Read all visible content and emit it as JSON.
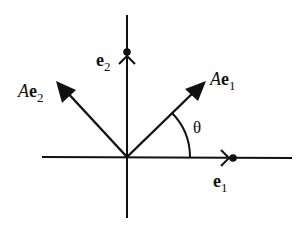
{
  "diagram": {
    "colors": {
      "stroke": "#111111",
      "background": "#ffffff"
    },
    "axes": {
      "horizontal": {
        "x1": 42,
        "y1": 157,
        "x2": 292,
        "y2": 158
      },
      "vertical": {
        "x1": 127,
        "y1": 15,
        "x2": 127,
        "y2": 218
      }
    },
    "origin": {
      "x": 127,
      "y": 157
    },
    "basis_vectors": [
      {
        "name": "e1",
        "label_main": "e",
        "label_sub": "1",
        "dot": {
          "x": 233,
          "y": 158
        },
        "label_pos": {
          "x": 216,
          "y": 187
        }
      },
      {
        "name": "e2",
        "label_main": "e",
        "label_sub": "2",
        "dot": {
          "x": 127,
          "y": 52
        },
        "label_pos": {
          "x": 96,
          "y": 64
        }
      }
    ],
    "transformed_vectors": [
      {
        "name": "Ae1",
        "label_prefix": "A",
        "label_main": "e",
        "label_sub": "1",
        "tip": {
          "x": 204,
          "y": 82
        },
        "label_pos": {
          "x": 236,
          "y": 88
        }
      },
      {
        "name": "Ae2",
        "label_prefix": "A",
        "label_main": "e",
        "label_sub": "2",
        "tip": {
          "x": 57,
          "y": 82
        },
        "label_pos": {
          "x": 22,
          "y": 96
        }
      }
    ],
    "angle": {
      "symbol": "θ",
      "radius": 63,
      "label_pos": {
        "x": 196,
        "y": 132
      }
    }
  }
}
